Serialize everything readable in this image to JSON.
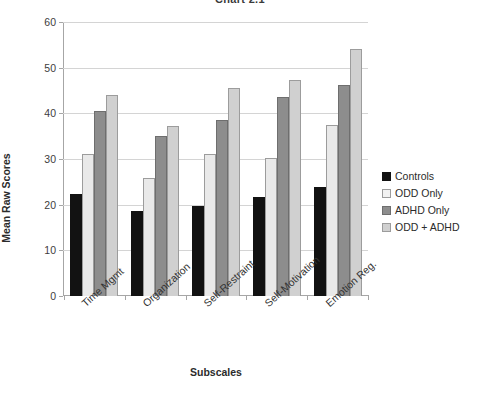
{
  "chart_data": {
    "type": "bar",
    "title": "Chart 2.1",
    "xlabel": "Subscales",
    "ylabel": "Mean Raw Scores",
    "ylim": [
      0,
      60
    ],
    "yticks": [
      0,
      10,
      20,
      30,
      40,
      50,
      60
    ],
    "grid": true,
    "legend_position": "right",
    "categories": [
      "Time Mgmt",
      "Organization",
      "Self-Restraint",
      "Self-Motivation",
      "Emotion Reg."
    ],
    "series": [
      {
        "name": "Controls",
        "color": "#121212",
        "values": [
          22.3,
          18.6,
          19.7,
          21.6,
          23.8
        ]
      },
      {
        "name": "ODD Only",
        "color": "#e9e9e9",
        "values": [
          31.0,
          25.9,
          31.1,
          30.2,
          37.4
        ]
      },
      {
        "name": "ADHD Only",
        "color": "#8d8d8d",
        "values": [
          40.5,
          35.0,
          38.5,
          43.5,
          46.3
        ]
      },
      {
        "name": "ODD + ADHD",
        "color": "#d0d0d0",
        "values": [
          44.0,
          37.3,
          45.5,
          47.2,
          54.2
        ]
      }
    ]
  }
}
